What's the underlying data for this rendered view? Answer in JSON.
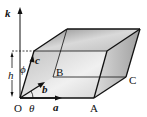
{
  "diagram": {
    "labels": {
      "k": "k",
      "c": "c",
      "b": "b",
      "a": "a",
      "h": "h",
      "phi": "ϕ",
      "theta": "θ",
      "O": "O",
      "A": "A",
      "B": "B",
      "C": "C"
    },
    "colors": {
      "edge": "#111111",
      "face_light": "#e6e6e6",
      "face_mid": "#c8c8c8",
      "face_dark": "#9a9a9a",
      "background": "#ffffff"
    }
  }
}
